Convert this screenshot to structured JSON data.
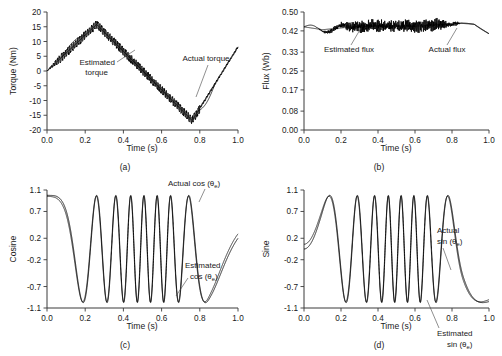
{
  "figure": {
    "background": "#ffffff",
    "trace_color": "#000000",
    "axis_color": "#3a3a3a"
  },
  "chart_data": [
    {
      "type": "line",
      "panel": "a",
      "caption": "(a)",
      "title": "",
      "xlabel": "Time (s)",
      "ylabel": "Torque (Nm)",
      "xlim": [
        0.0,
        1.0
      ],
      "ylim": [
        -20,
        20
      ],
      "xticks": [
        0.0,
        0.2,
        0.4,
        0.6,
        0.8,
        1.0
      ],
      "xticklabels": [
        "0.0",
        "0.2",
        "0.4",
        "0.6",
        "0.8",
        "1.0"
      ],
      "yticks": [
        -20,
        -15,
        -10,
        -5,
        0,
        5,
        10,
        15,
        20
      ],
      "yticklabels": [
        "-20",
        "-15",
        "-10",
        "-5",
        "0",
        "5",
        "10",
        "15",
        "20"
      ],
      "grid": false,
      "legend": "annotations",
      "annotations": [
        {
          "text": "Estimated torque",
          "lines": [
            "Estimated",
            "torque"
          ]
        },
        {
          "text": "Actual torque",
          "lines": [
            "Actual torque"
          ]
        }
      ],
      "series": [
        {
          "name": "Actual torque",
          "description": "smooth triangular torque reference",
          "x": [
            0.0,
            0.26,
            0.76,
            1.0
          ],
          "values": [
            0.0,
            15.8,
            -16.8,
            8.2
          ]
        },
        {
          "name": "Estimated torque",
          "description": "triangular ramp with high-frequency ripple band",
          "x": [
            0.0,
            0.26,
            0.76,
            1.0
          ],
          "values": [
            0.0,
            15.8,
            -16.8,
            8.2
          ],
          "ripple_amplitude": 1.3,
          "ripple_frequency_hz": 95
        }
      ]
    },
    {
      "type": "line",
      "panel": "b",
      "caption": "(b)",
      "title": "",
      "xlabel": "Time (s)",
      "ylabel": "Flux (Wb)",
      "xlim": [
        0.0,
        1.0
      ],
      "ylim": [
        0.0,
        0.5
      ],
      "xticks": [
        0.0,
        0.2,
        0.4,
        0.6,
        0.8,
        1.0
      ],
      "xticklabels": [
        "0.0",
        "0.2",
        "0.4",
        "0.6",
        "0.8",
        "1.0"
      ],
      "yticks": [
        0.0,
        0.08,
        0.17,
        0.25,
        0.33,
        0.42,
        0.5
      ],
      "yticklabels": [
        "0.00",
        "0.08",
        "0.17",
        "0.25",
        "0.33",
        "0.42",
        "0.50"
      ],
      "grid": false,
      "legend": "annotations",
      "annotations": [
        {
          "text": "Estimated flux",
          "lines": [
            "Estimated flux"
          ]
        },
        {
          "text": "Actual flux",
          "lines": [
            "Actual flux"
          ]
        }
      ],
      "series": [
        {
          "name": "Actual flux",
          "description": "smooth flux reference near 0.44 Wb, dips after 0.9 s",
          "x": [
            0.0,
            0.1,
            0.3,
            0.6,
            0.85,
            0.92,
            1.0
          ],
          "values": [
            0.437,
            0.425,
            0.44,
            0.44,
            0.452,
            0.448,
            0.408
          ]
        },
        {
          "name": "Estimated flux",
          "description": "flux estimate with dense chattering ripple band",
          "nominal": 0.44,
          "ripple_amplitude": 0.022,
          "ripple_frequency_hz": 170
        }
      ]
    },
    {
      "type": "line",
      "panel": "c",
      "caption": "(c)",
      "title": "",
      "xlabel": "Time (s)",
      "ylabel": "Cosine",
      "xlim": [
        0.0,
        1.0
      ],
      "ylim": [
        -1.1,
        1.1
      ],
      "xticks": [
        0.0,
        0.2,
        0.4,
        0.6,
        0.8,
        1.0
      ],
      "xticklabels": [
        "0.0",
        "0.2",
        "0.4",
        "0.6",
        "0.8",
        "1.0"
      ],
      "yticks": [
        -1.1,
        -0.7,
        -0.2,
        0.2,
        0.7,
        1.1
      ],
      "yticklabels": [
        "-1.1",
        "-0.7",
        "-0.2",
        "0.2",
        "0.7",
        "1.1"
      ],
      "grid": false,
      "legend": "annotations",
      "annotations": [
        {
          "text": "Actual cos (θe)",
          "lines": [
            "Actual cos (θ",
            "e",
            ")"
          ]
        },
        {
          "text": "Estimated cos (θe)",
          "lines": [
            "Estimated",
            "cos (θ",
            "e",
            ")"
          ]
        }
      ],
      "series": [
        {
          "name": "Actual cos (θe)",
          "description": "cosine of electrical angle, frequency chirps up then down",
          "waveform": "cos",
          "amplitude": 1.0,
          "peak_frequency_hz": 14.5,
          "start_frequency_hz": 0.0
        },
        {
          "name": "Estimated cos (θe)",
          "description": "estimated cosine overlapping the actual trace",
          "waveform": "cos",
          "amplitude": 1.0,
          "peak_frequency_hz": 14.5,
          "start_frequency_hz": 0.0
        }
      ]
    },
    {
      "type": "line",
      "panel": "d",
      "caption": "(d)",
      "title": "",
      "xlabel": "Time (s)",
      "ylabel": "Sine",
      "xlim": [
        0.0,
        1.0
      ],
      "ylim": [
        -1.1,
        1.1
      ],
      "xticks": [
        0.0,
        0.2,
        0.4,
        0.6,
        0.8,
        1.0
      ],
      "xticklabels": [
        "0.0",
        "0.2",
        "0.4",
        "0.6",
        "0.8",
        "1.0"
      ],
      "yticks": [
        -1.1,
        -0.7,
        -0.2,
        0.2,
        0.7,
        1.1
      ],
      "yticklabels": [
        "-1.1",
        "-0.7",
        "-0.2",
        "0.2",
        "0.7",
        "1.1"
      ],
      "grid": false,
      "legend": "annotations",
      "annotations": [
        {
          "text": "Actual sin (θe)",
          "lines": [
            "Actual",
            "sin (θ",
            "e",
            ")"
          ]
        },
        {
          "text": "Estimated sin (θe)",
          "lines": [
            "Estimated",
            "sin (θ",
            "e",
            ")"
          ]
        }
      ],
      "series": [
        {
          "name": "Actual sin (θe)",
          "description": "sine of electrical angle, frequency chirps up then down",
          "waveform": "sin",
          "amplitude": 1.0,
          "peak_frequency_hz": 14.5,
          "start_frequency_hz": 0.0
        },
        {
          "name": "Estimated sin (θe)",
          "description": "estimated sine overlapping the actual trace",
          "waveform": "sin",
          "amplitude": 1.0,
          "peak_frequency_hz": 14.5,
          "start_frequency_hz": 0.0
        }
      ]
    }
  ],
  "panels": {
    "a": {
      "ylabel": "Torque (Nm)",
      "xlabel": "Time (s)",
      "caption": "(a)",
      "annot_estimated_l1": "Estimated",
      "annot_estimated_l2": "torque",
      "annot_actual": "Actual torque"
    },
    "b": {
      "ylabel": "Flux (Wb)",
      "xlabel": "Time (s)",
      "caption": "(b)",
      "annot_estimated": "Estimated flux",
      "annot_actual": "Actual flux"
    },
    "c": {
      "ylabel": "Cosine",
      "xlabel": "Time (s)",
      "caption": "(c)",
      "annot_actual_l1": "Actual cos (θ",
      "annot_actual_sub": "e",
      "annot_actual_l2": ")",
      "annot_estimated_l1": "Estimated",
      "annot_estimated_l2": "cos (θ",
      "annot_estimated_sub": "e",
      "annot_estimated_l3": ")"
    },
    "d": {
      "ylabel": "Sine",
      "xlabel": "Time (s)",
      "caption": "(d)",
      "annot_actual_l1": "Actual",
      "annot_actual_l2": "sin (θ",
      "annot_actual_sub": "e",
      "annot_actual_l3": ")",
      "annot_estimated_l1": "Estimated",
      "annot_estimated_l2": "sin (θ",
      "annot_estimated_sub": "e",
      "annot_estimated_l3": ")"
    }
  }
}
